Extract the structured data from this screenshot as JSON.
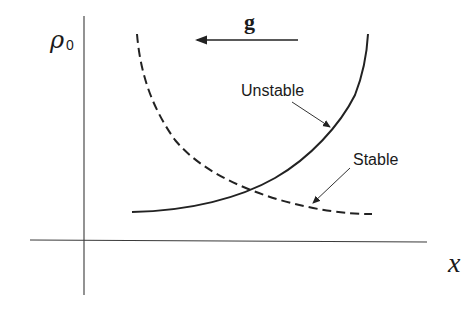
{
  "diagram": {
    "y_axis_label": {
      "symbol": "ρ",
      "subscript": "0"
    },
    "x_axis_label": "x",
    "gravity_label": "g",
    "gravity_direction": "left",
    "curves": [
      {
        "name": "Unstable",
        "style": "solid",
        "label": "Unstable"
      },
      {
        "name": "Stable",
        "style": "dashed",
        "label": "Stable"
      }
    ],
    "colors": {
      "ink": "#222222",
      "background": "#ffffff"
    }
  }
}
